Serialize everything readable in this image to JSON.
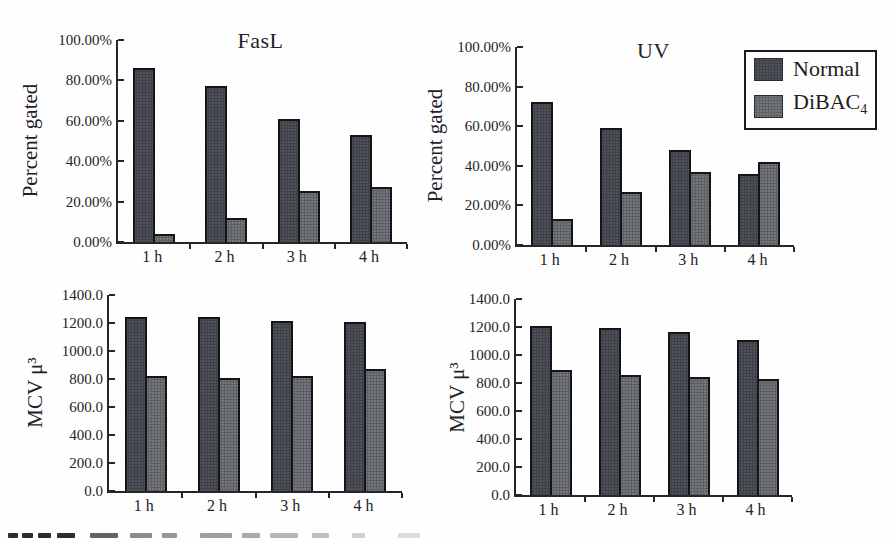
{
  "figure": {
    "left_column_title": "FasL",
    "right_column_title": "UV",
    "percent_axis_label": "Percent gated",
    "mcv_axis_label": "MCV μ³"
  },
  "legend": {
    "items": [
      {
        "label": "Normal",
        "sub": "",
        "color": "#4f525b"
      },
      {
        "label": "DiBAC",
        "sub": "4",
        "color": "#75797e"
      }
    ]
  },
  "series_colors": {
    "Normal": "#4f525b",
    "DiBAC4": "#75797e"
  },
  "chart_data": [
    {
      "type": "bar",
      "title": "FasL",
      "ylabel": "Percent gated",
      "xlabel": "",
      "categories": [
        "1 h",
        "2 h",
        "3 h",
        "4 h"
      ],
      "ylim": [
        0,
        100
      ],
      "yticks": [
        0,
        20,
        40,
        60,
        80,
        100
      ],
      "ytick_labels": [
        "0.00%",
        "20.00%",
        "40.00%",
        "60.00%",
        "80.00%",
        "100.00%"
      ],
      "grid": false,
      "legend_position": "top-right-outside",
      "series": [
        {
          "name": "Normal",
          "values": [
            86,
            77,
            61,
            53
          ]
        },
        {
          "name": "DiBAC4",
          "values": [
            4,
            12,
            25,
            27
          ]
        }
      ]
    },
    {
      "type": "bar",
      "title": "UV",
      "ylabel": "Percent gated",
      "xlabel": "",
      "categories": [
        "1 h",
        "2 h",
        "3 h",
        "4 h"
      ],
      "ylim": [
        0,
        100
      ],
      "yticks": [
        0,
        20,
        40,
        60,
        80,
        100
      ],
      "ytick_labels": [
        "0.00%",
        "20.00%",
        "40.00%",
        "60.00%",
        "80.00%",
        "100.00%"
      ],
      "grid": false,
      "legend_position": "top-right-outside",
      "series": [
        {
          "name": "Normal",
          "values": [
            72,
            59,
            48,
            36
          ]
        },
        {
          "name": "DiBAC4",
          "values": [
            13,
            27,
            37,
            42
          ]
        }
      ]
    },
    {
      "type": "bar",
      "title": "",
      "ylabel": "MCV μ³",
      "xlabel": "",
      "categories": [
        "1 h",
        "2 h",
        "3 h",
        "4 h"
      ],
      "ylim": [
        0,
        1400
      ],
      "yticks": [
        0,
        200,
        400,
        600,
        800,
        1000,
        1200,
        1400
      ],
      "ytick_labels": [
        "0.0",
        "200.0",
        "400.0",
        "600.0",
        "800.0",
        "1000.0",
        "1200.0",
        "1400.0"
      ],
      "grid": false,
      "series": [
        {
          "name": "Normal",
          "values": [
            1240,
            1240,
            1215,
            1210
          ]
        },
        {
          "name": "DiBAC4",
          "values": [
            820,
            810,
            820,
            870
          ]
        }
      ]
    },
    {
      "type": "bar",
      "title": "",
      "ylabel": "MCV μ³",
      "xlabel": "",
      "categories": [
        "1 h",
        "2 h",
        "3 h",
        "4 h"
      ],
      "ylim": [
        0,
        1400
      ],
      "yticks": [
        0,
        200,
        400,
        600,
        800,
        1000,
        1200,
        1400
      ],
      "ytick_labels": [
        "0.0",
        "200.0",
        "400.0",
        "600.0",
        "800.0",
        "1000.0",
        "1200.0",
        "1400.0"
      ],
      "grid": false,
      "series": [
        {
          "name": "Normal",
          "values": [
            1205,
            1190,
            1165,
            1110
          ]
        },
        {
          "name": "DiBAC4",
          "values": [
            895,
            855,
            840,
            830
          ]
        }
      ]
    }
  ]
}
